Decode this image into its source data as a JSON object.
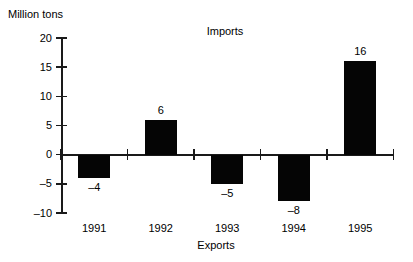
{
  "chart_data": {
    "type": "bar",
    "title": "",
    "xlabel": "",
    "ylabel": "Million tons",
    "categories": [
      "1991",
      "1992",
      "1993",
      "1994",
      "1995"
    ],
    "values": [
      -4,
      6,
      -5,
      -8,
      16
    ],
    "value_labels": [
      "–4",
      "6",
      "–5",
      "–8",
      "16"
    ],
    "ylim": [
      -10,
      20
    ],
    "ytick_values": [
      20,
      15,
      10,
      5,
      0,
      -5,
      -10
    ],
    "ytick_labels": [
      "20",
      "15",
      "10",
      "5",
      "0",
      "–5",
      "–10"
    ],
    "grid": false,
    "legend": "none",
    "annotations": [
      {
        "text": "Imports",
        "meaning": "positive-direction-label"
      },
      {
        "text": "Exports",
        "meaning": "negative-direction-label"
      }
    ],
    "bar_color": "#050505",
    "axis_color": "#1a1a1a",
    "background_color": "#ffffff"
  },
  "axis": {
    "y_title": "Million tons"
  },
  "annotations": {
    "imports": "Imports",
    "exports": "Exports"
  }
}
